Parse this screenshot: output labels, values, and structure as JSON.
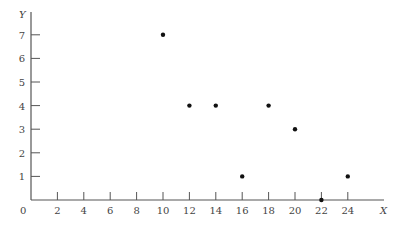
{
  "chart_data": {
    "type": "scatter",
    "title": "",
    "xlabel": "X",
    "ylabel": "Y",
    "xlim": [
      0,
      25
    ],
    "ylim": [
      0,
      7.7
    ],
    "grid": false,
    "legend": null,
    "x_ticks": [
      2,
      4,
      6,
      8,
      10,
      12,
      14,
      16,
      18,
      20,
      22,
      24
    ],
    "y_ticks": [
      1,
      2,
      3,
      4,
      5,
      6,
      7
    ],
    "origin_label": "0",
    "series": [
      {
        "name": "points",
        "x": [
          10,
          12,
          14,
          16,
          18,
          20,
          22,
          24
        ],
        "y": [
          7,
          4,
          4,
          1,
          4,
          3,
          0,
          1
        ]
      }
    ]
  },
  "colors": {
    "axis": "#555555",
    "point": "#111111",
    "text": "#444444"
  }
}
